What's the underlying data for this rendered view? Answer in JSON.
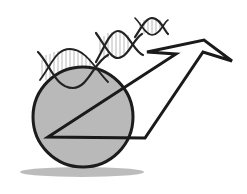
{
  "illustration": {
    "description": "Grayscale icon: DNA double helix above a gray circle with an upward-right outlined arrow",
    "colors": {
      "background": "#ffffff",
      "stroke": "#1c1c1c",
      "circle_fill": "#b8b8b8",
      "shadow": "#9a9a9a",
      "rung": "#9c9c9c"
    },
    "icons": [
      "dna-helix-icon",
      "circle-icon",
      "arrow-icon",
      "shadow-ellipse"
    ]
  }
}
